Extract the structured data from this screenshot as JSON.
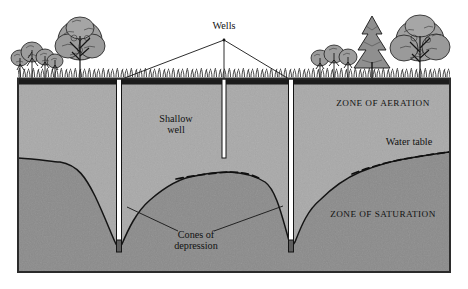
{
  "figure": {
    "type": "cross-section-diagram",
    "frame": {
      "x": 18,
      "y": 78,
      "width": 432,
      "height": 194,
      "border_color": "#2b2b2b"
    }
  },
  "labels": {
    "wells": "Wells",
    "shallow_well": "Shallow\nwell",
    "zone_of_aeration": "ZONE OF AERATION",
    "zone_of_saturation": "ZONE OF SATURATION",
    "water_table": "Water table",
    "cones_of_depression": "Cones of\ndepression"
  },
  "colors": {
    "zone_aeration": "#a9a9a9",
    "zone_saturation": "#8b8b8b",
    "surface_soil": "#1c1c1c",
    "line": "#1a1a1a",
    "well_fill": "#ffffff",
    "text": "#121212",
    "page": "#ffffff"
  },
  "geometry": {
    "ground_surface_y": 84,
    "block_bottom_y": 272,
    "block_left_x": 18,
    "block_right_x": 450,
    "wells": [
      {
        "name": "left-deep-well",
        "x": 119,
        "top_y": 84,
        "bottom_y": 247,
        "width": 5,
        "reaches_water_table": true
      },
      {
        "name": "middle-shallow-well",
        "x": 224,
        "top_y": 84,
        "bottom_y": 158,
        "width": 4,
        "reaches_water_table": false
      },
      {
        "name": "right-deep-well",
        "x": 291,
        "top_y": 84,
        "bottom_y": 247,
        "width": 5,
        "reaches_water_table": true
      }
    ],
    "water_table_points": [
      {
        "x": 18,
        "y": 158
      },
      {
        "x": 60,
        "y": 162
      },
      {
        "x": 95,
        "y": 196
      },
      {
        "x": 115,
        "y": 240
      },
      {
        "x": 119,
        "y": 247
      },
      {
        "x": 124,
        "y": 240
      },
      {
        "x": 150,
        "y": 200
      },
      {
        "x": 195,
        "y": 176
      },
      {
        "x": 230,
        "y": 172
      },
      {
        "x": 265,
        "y": 182
      },
      {
        "x": 285,
        "y": 226
      },
      {
        "x": 291,
        "y": 247
      },
      {
        "x": 297,
        "y": 238
      },
      {
        "x": 320,
        "y": 200
      },
      {
        "x": 360,
        "y": 172
      },
      {
        "x": 410,
        "y": 158
      },
      {
        "x": 450,
        "y": 152
      }
    ],
    "leader_lines": {
      "wells_apex": {
        "x": 224,
        "y": 42
      },
      "wells_targets": [
        {
          "x": 122,
          "y": 82
        },
        {
          "x": 224,
          "y": 84
        },
        {
          "x": 288,
          "y": 82
        }
      ],
      "cones_apex_left": {
        "x": 178,
        "y": 230
      },
      "cones_apex_right": {
        "x": 214,
        "y": 230
      },
      "cones_targets": [
        {
          "x": 128,
          "y": 208
        },
        {
          "x": 282,
          "y": 207
        }
      ]
    }
  },
  "vegetation": {
    "left_group": [
      "shrub-cluster",
      "deciduous-tree"
    ],
    "right_group": [
      "shrub-cluster",
      "conifer-tree",
      "deciduous-tree"
    ],
    "grass": "grass-tuft-band"
  },
  "label_positions": {
    "wells": {
      "x": 224,
      "y": 26
    },
    "shallow_well": {
      "x": 175,
      "y": 120
    },
    "zone_of_aeration": {
      "x": 383,
      "y": 104
    },
    "zone_of_saturation": {
      "x": 383,
      "y": 215
    },
    "water_table": {
      "x": 409,
      "y": 142
    },
    "cones_of_depression": {
      "x": 196,
      "y": 232
    }
  }
}
